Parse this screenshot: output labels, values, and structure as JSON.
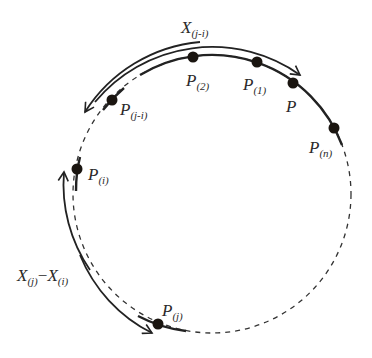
{
  "diagram": {
    "type": "circular order statistics / spacing diagram",
    "circle": {
      "center": [
        212,
        194
      ],
      "radius": 139
    },
    "colors": {
      "stroke": "#222222",
      "point": "#1a1510",
      "text": "#2a2a2a",
      "background": "#ffffff"
    },
    "points": [
      {
        "id": "p2",
        "main": "P",
        "sub": "(2)"
      },
      {
        "id": "p1",
        "main": "P",
        "sub": "(1)"
      },
      {
        "id": "p",
        "main": "P",
        "sub": ""
      },
      {
        "id": "pn",
        "main": "P",
        "sub": "(n)"
      },
      {
        "id": "pji",
        "main": "P",
        "sub": "(j-i)"
      },
      {
        "id": "pi",
        "main": "P",
        "sub": "(i)"
      },
      {
        "id": "pj",
        "main": "P",
        "sub": "(j)"
      }
    ],
    "arrows": [
      {
        "id": "top-arrow",
        "label_main": "X",
        "label_sub": "(j-i)"
      },
      {
        "id": "left-arrow",
        "label_main1": "X",
        "label_sub1": "(j)",
        "minus": "−",
        "label_main2": "X",
        "label_sub2": "(i)"
      }
    ]
  }
}
